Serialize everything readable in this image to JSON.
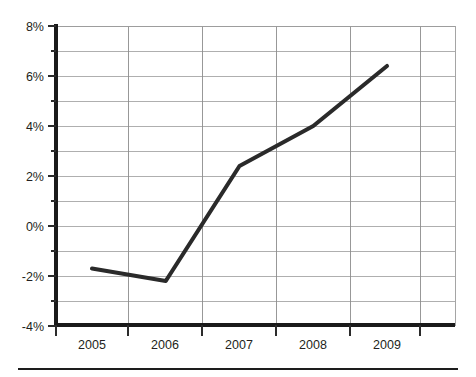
{
  "chart_data": {
    "type": "line",
    "title": "",
    "subtitle": "",
    "xlabel": "",
    "ylabel": "",
    "categories": [
      "2005",
      "2006",
      "2007",
      "2008",
      "2009"
    ],
    "x": [
      2005,
      2006,
      2007,
      2008,
      2009
    ],
    "values": [
      -1.7,
      -2.2,
      2.4,
      4.0,
      6.4
    ],
    "series": [
      {
        "name": "",
        "values": [
          -1.7,
          -2.2,
          2.4,
          4.0,
          6.4
        ]
      }
    ],
    "ylim": [
      -4,
      8
    ],
    "xlim": [
      2004.5,
      2010.0
    ],
    "y_tick_labels": [
      "8%",
      "6%",
      "4%",
      "2%",
      "0%",
      "-2%",
      "-4%"
    ],
    "y_tick_values": [
      8,
      6,
      4,
      2,
      0,
      -2,
      -4
    ],
    "y_minor_tick_values": [
      7,
      5,
      3,
      1,
      -1,
      -3
    ],
    "x_tick_labels": [
      "2005",
      "2006",
      "2007",
      "2008",
      "2009"
    ],
    "grid": true,
    "grid_axis": "both",
    "legend": false,
    "legend_position": "none",
    "line_color": "#2a2a2a",
    "grid_color": "#9b9b9b",
    "axis_color": "#1a1a1a",
    "background": "#ffffff",
    "annotations": []
  },
  "figure": {
    "has_footer_rule": true
  }
}
